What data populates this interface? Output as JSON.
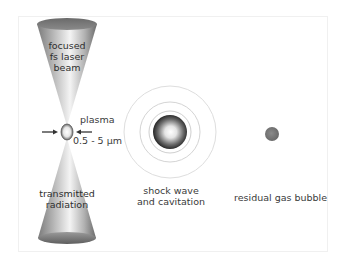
{
  "diagram": {
    "beam": {
      "top_label": [
        "focused",
        "fs laser",
        "beam"
      ],
      "bottom_label": [
        "transmitted",
        "radiation"
      ]
    },
    "plasma": {
      "label": "plasma",
      "size_label": "0.5 - 5 µm"
    },
    "shock": {
      "label": [
        "shock wave",
        "and cavitation"
      ]
    },
    "bubble": {
      "label": "residual gas bubble"
    },
    "colors": {
      "cone_dark": "#6e6e6e",
      "cone_light": "#f2f2f2",
      "ring": "#d8d8d8",
      "sphere_dark": "#2c2c2c",
      "bubble": "#777777",
      "text": "#3a3a3a"
    }
  }
}
